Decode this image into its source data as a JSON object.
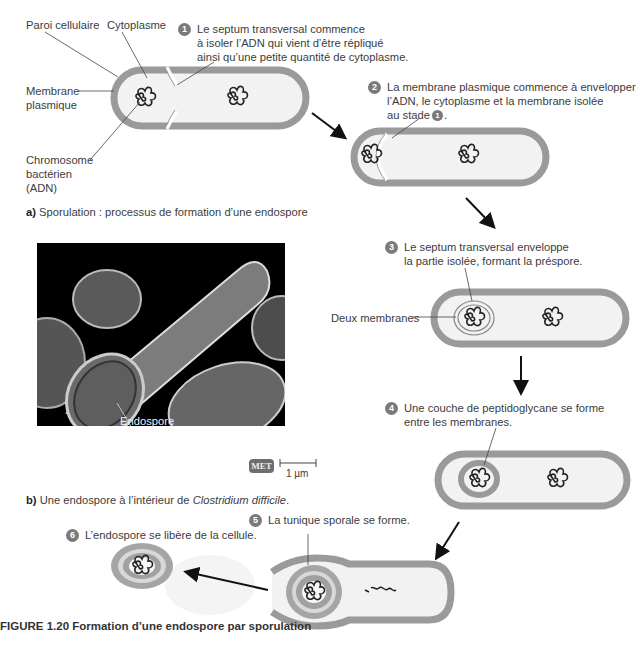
{
  "diagram": {
    "part_a_caption": {
      "prefix": "a)",
      "text": "Sporulation : processus de formation d’une endospore"
    },
    "part_b_caption": {
      "prefix": "b)",
      "text_before": "Une endospore à l’intérieur de ",
      "species": "Clostridium difficile",
      "text_after": "."
    },
    "figure_caption": "FIGURE 1.20 Formation d’une endospore par sporulation",
    "labels": {
      "cell_wall": "Paroi cellulaire",
      "cytoplasm": "Cytoplasme",
      "plasma_membrane_line1": "Membrane",
      "plasma_membrane_line2": "plasmique",
      "chromosome_line1": "Chromosome",
      "chromosome_line2": "bactérien",
      "chromosome_line3": "(ADN)",
      "two_membranes": "Deux membranes",
      "endospore": "Endospore"
    },
    "micrograph": {
      "badge": "MET",
      "scale_label": "1 µm"
    },
    "steps": [
      {
        "number": "1",
        "lines": [
          "Le septum transversal commence",
          "à isoler l’ADN qui vient d’être répliqué",
          "ainsi qu’une petite quantité de cytoplasme."
        ]
      },
      {
        "number": "2",
        "lines": [
          "La membrane plasmique commence à envelopper",
          "l’ADN, le cytoplasme et la membrane isolée",
          "au stade"
        ],
        "ref_step": "1"
      },
      {
        "number": "3",
        "lines": [
          "Le septum transversal enveloppe",
          "la partie isolée, formant la préspore."
        ]
      },
      {
        "number": "4",
        "lines": [
          "Une couche de peptidoglycane se forme",
          "entre les membranes."
        ]
      },
      {
        "number": "5",
        "lines": [
          "La tunique sporale se forme."
        ]
      },
      {
        "number": "6",
        "lines": [
          "L’endospore se libère de la cellule."
        ]
      }
    ],
    "colors": {
      "wall": "#9a9a9a",
      "cytoplasm": "#f2f2f2",
      "badge": "#7a7a7a",
      "dna": "#222222",
      "micrograph_bg": "#000000"
    }
  }
}
